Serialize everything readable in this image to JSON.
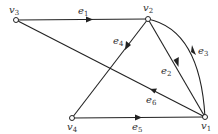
{
  "diagram": {
    "type": "directed-graph",
    "vertices": [
      {
        "id": "v1",
        "label": "v",
        "sub": "1",
        "x": 205,
        "y": 117
      },
      {
        "id": "v2",
        "label": "v",
        "sub": "2",
        "x": 148,
        "y": 19
      },
      {
        "id": "v3",
        "label": "v",
        "sub": "3",
        "x": 16,
        "y": 20
      },
      {
        "id": "v4",
        "label": "v",
        "sub": "4",
        "x": 72,
        "y": 118
      }
    ],
    "edges": [
      {
        "id": "e1",
        "label": "e",
        "sub": "1",
        "from": "v3",
        "to": "v2",
        "shape": "straight"
      },
      {
        "id": "e2",
        "label": "e",
        "sub": "2",
        "from": "v2",
        "to": "v1",
        "shape": "straight"
      },
      {
        "id": "e3",
        "label": "e",
        "sub": "3",
        "from": "v1",
        "to": "v2",
        "shape": "arc"
      },
      {
        "id": "e4",
        "label": "e",
        "sub": "4",
        "from": "v2",
        "to": "v4",
        "shape": "straight"
      },
      {
        "id": "e5",
        "label": "e",
        "sub": "5",
        "from": "v4",
        "to": "v1",
        "shape": "straight"
      },
      {
        "id": "e6",
        "label": "e",
        "sub": "6",
        "from": "v1",
        "to": "v3",
        "shape": "straight"
      }
    ],
    "colors": {
      "stroke": "#222222",
      "background": "#ffffff"
    }
  }
}
